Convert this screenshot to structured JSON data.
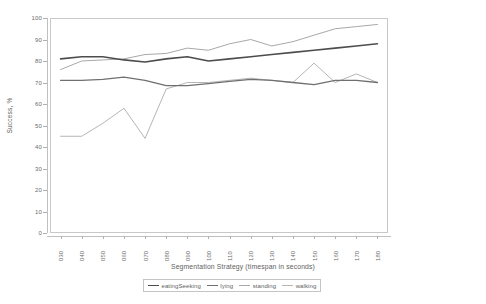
{
  "chart_data": {
    "type": "line",
    "title": "",
    "xlabel": "Segmentation Strategy (timespan in seconds)",
    "ylabel": "Success, %",
    "categories": [
      "030",
      "040",
      "050",
      "060",
      "070",
      "080",
      "090",
      "100",
      "110",
      "120",
      "130",
      "140",
      "150",
      "160",
      "170",
      "180"
    ],
    "ylim": [
      0,
      100
    ],
    "yticks": [
      0,
      10,
      20,
      30,
      40,
      50,
      60,
      70,
      80,
      90,
      100
    ],
    "grid": false,
    "legend_position": "bottom",
    "series": [
      {
        "name": "eatingSeeking",
        "color": "#4d4d4d",
        "width": 1.6,
        "values": [
          81,
          82,
          82,
          80.5,
          79.5,
          81,
          82,
          80,
          81,
          82,
          83,
          84,
          85,
          86,
          87,
          88
        ]
      },
      {
        "name": "lying",
        "color": "#707070",
        "width": 1.3,
        "values": [
          71,
          71,
          71.5,
          72.5,
          71,
          68.5,
          68.5,
          69.5,
          70.5,
          71.5,
          71,
          70,
          69,
          71,
          71,
          70
        ]
      },
      {
        "name": "standing",
        "color": "#a8a8a8",
        "width": 1.0,
        "values": [
          76,
          80,
          80.5,
          81,
          83,
          83.5,
          86,
          85,
          88,
          90,
          87,
          89,
          92,
          95,
          96,
          97
        ]
      },
      {
        "name": "walking",
        "color": "#b5b5b5",
        "width": 1.0,
        "values": [
          45,
          45,
          51,
          58,
          44,
          67,
          70,
          70,
          71,
          72,
          71,
          70,
          79,
          70,
          74,
          70
        ]
      }
    ]
  },
  "legend": {
    "items": [
      {
        "label": "eatingSeeking"
      },
      {
        "label": "lying"
      },
      {
        "label": "standing"
      },
      {
        "label": "walking"
      }
    ]
  }
}
